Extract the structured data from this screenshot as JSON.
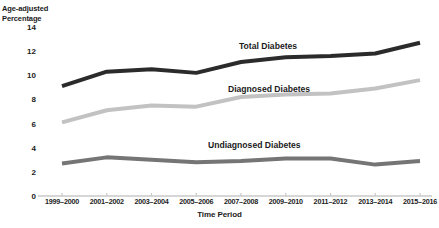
{
  "chart_data": {
    "type": "line",
    "title": "",
    "xlabel": "Time Period",
    "ylabel": "Age-adjusted\nPercentage",
    "categories": [
      "1999–2000",
      "2001–2002",
      "2003–2004",
      "2005–2006",
      "2007–2008",
      "2009–2010",
      "2011–2012",
      "2013–2014",
      "2015–2016"
    ],
    "yticks": [
      0,
      2,
      4,
      6,
      8,
      10,
      12,
      14
    ],
    "ylim": [
      0,
      14
    ],
    "grid": false,
    "legend_position": "inline-labels",
    "series": [
      {
        "name": "Total Diabetes",
        "color": "#2b2b2b",
        "values": [
          9.1,
          10.3,
          10.5,
          10.2,
          11.1,
          11.5,
          11.6,
          11.8,
          12.7
        ]
      },
      {
        "name": "Diagnosed Diabetes",
        "color": "#c2c2c2",
        "values": [
          6.1,
          7.1,
          7.5,
          7.4,
          8.2,
          8.4,
          8.5,
          8.9,
          9.6
        ]
      },
      {
        "name": "Undiagnosed Diabetes",
        "color": "#757575",
        "values": [
          2.7,
          3.2,
          3.0,
          2.8,
          2.9,
          3.1,
          3.1,
          2.6,
          2.9
        ]
      }
    ]
  },
  "labels": {
    "y_axis_title": "Age-adjusted\nPercentage",
    "x_axis_title": "Time Period",
    "series_total": "Total Diabetes",
    "series_diagnosed": "Diagnosed Diabetes",
    "series_undiagnosed": "Undiagnosed Diabetes"
  }
}
